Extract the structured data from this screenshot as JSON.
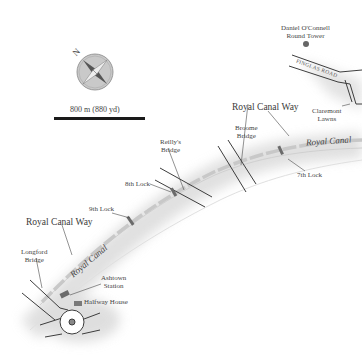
{
  "map": {
    "title": "Royal Canal Way walking route map",
    "compass": {
      "label": "N",
      "icon": "compass-rose-icon"
    },
    "scale_bar": {
      "label": "800 m (880 yd)"
    },
    "landmarks": {
      "tower": {
        "label_line1": "Daniel O'Connell",
        "label_line2": "Round Tower"
      },
      "finglas_road": {
        "label": "FINGLAS ROAD"
      },
      "claremont": {
        "label_line1": "Claremont",
        "label_line2": "Lawns"
      },
      "royal_canal_way_top": {
        "label": "Royal Canal Way"
      },
      "royal_canal_way_left": {
        "label": "Royal Canal Way"
      },
      "royal_canal_top": {
        "label": "Royal Canal"
      },
      "royal_canal_left": {
        "label": "Royal Canal"
      },
      "broome_bridge": {
        "label_line1": "Broome",
        "label_line2": "Bridge"
      },
      "reillys_bridge": {
        "label_line1": "Reilly's",
        "label_line2": "Bridge"
      },
      "lock7": {
        "label": "7th Lock"
      },
      "lock8": {
        "label": "8th Lock"
      },
      "lock9": {
        "label": "9th Lock"
      },
      "longford_bridge": {
        "label_line1": "Longford",
        "label_line2": "Bridge"
      },
      "ashtown_station": {
        "label_line1": "Ashtown",
        "label_line2": "Station"
      },
      "halfway_house": {
        "label": "Halfway House"
      }
    },
    "colors": {
      "canal_path": "#c8c8c8",
      "road_line": "#3d3d3d",
      "shadow": "#e2e2e2",
      "compass_fill": "#c9c9c9",
      "lock": "#6b6b6b",
      "tower_dot": "#666666"
    }
  }
}
